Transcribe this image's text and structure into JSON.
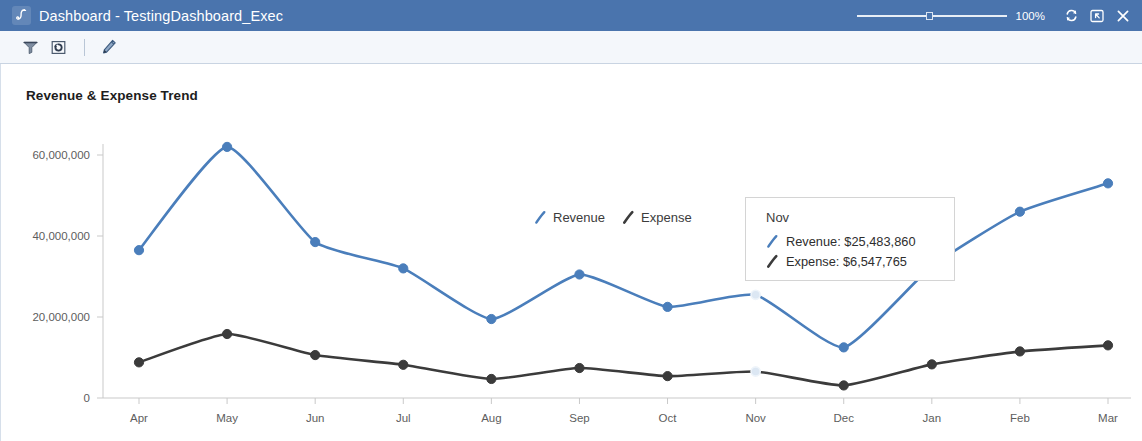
{
  "window": {
    "title": "Dashboard - TestingDashboard_Exec",
    "logo_icon": "jasper-logo-icon",
    "zoom_level": "100%",
    "controls": [
      {
        "name": "refresh-icon",
        "label": "Refresh"
      },
      {
        "name": "export-icon",
        "label": "Export"
      },
      {
        "name": "close-icon",
        "label": "Close"
      }
    ]
  },
  "toolbar": {
    "items": [
      {
        "name": "filter-icon",
        "label": "Filter"
      },
      {
        "name": "refresh-dashboard-icon",
        "label": "Refresh Dashboard"
      },
      {
        "name": "edit-icon",
        "label": "Edit"
      }
    ]
  },
  "colors": {
    "titlebar": "#4a74ad",
    "revenue": "#4a7ebb",
    "expense": "#3b3b3b",
    "highlight": "#dce7f3",
    "axis": "#c9c9c9",
    "toolbar_bg": "#f4f7fb"
  },
  "legend": {
    "items": [
      {
        "label": "Revenue",
        "color": "#4a7ebb"
      },
      {
        "label": "Expense",
        "color": "#3b3b3b"
      }
    ]
  },
  "tooltip": {
    "header": "Nov",
    "rows": [
      {
        "label": "Revenue: $25,483,860",
        "color": "#4a7ebb"
      },
      {
        "label": "Expense: $6,547,765",
        "color": "#3b3b3b"
      }
    ]
  },
  "chart_data": {
    "type": "line",
    "title": "Revenue & Expense Trend",
    "xlabel": "",
    "ylabel": "",
    "categories": [
      "Apr",
      "May",
      "Jun",
      "Jul",
      "Aug",
      "Sep",
      "Oct",
      "Nov",
      "Dec",
      "Jan",
      "Feb",
      "Mar"
    ],
    "ytick_labels": [
      "0",
      "20,000,000",
      "40,000,000",
      "60,000,000"
    ],
    "yticks": [
      0,
      20000000,
      40000000,
      60000000
    ],
    "ylim": [
      0,
      68000000
    ],
    "grid": false,
    "legend_position": "inside-top-center",
    "highlight_category": "Nov",
    "series": [
      {
        "name": "Revenue",
        "color": "#4a7ebb",
        "values": [
          36500000,
          62000000,
          38500000,
          32000000,
          19500000,
          30500000,
          22500000,
          25483860,
          12500000,
          32500000,
          46000000,
          53000000
        ]
      },
      {
        "name": "Expense",
        "color": "#3b3b3b",
        "values": [
          8800000,
          15800000,
          10600000,
          8200000,
          4700000,
          7400000,
          5400000,
          6547765,
          3100000,
          8300000,
          11500000,
          13000000
        ]
      }
    ]
  }
}
